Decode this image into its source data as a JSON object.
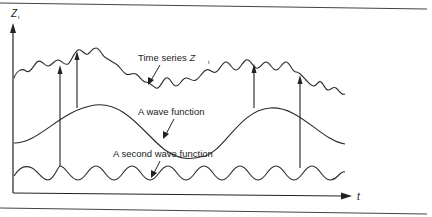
{
  "figure": {
    "axes": {
      "y_label": "Z",
      "y_label_subscript": "t",
      "x_label": "t"
    },
    "labels": {
      "time_series": "Time series ",
      "time_series_var": "Z",
      "time_series_sub": "t",
      "wave_function": "A wave function",
      "second_wave_function": "A second wave function"
    },
    "curves": [
      {
        "name": "Time series Z_t",
        "description": "irregular wiggly curve, rising then falling"
      },
      {
        "name": "A wave function",
        "description": "low-frequency sinusoid"
      },
      {
        "name": "A second wave function",
        "description": "high-frequency sinusoid"
      }
    ],
    "colors": {
      "line": "#2a2a2a",
      "rule": "#444444",
      "background": "#ffffff"
    }
  }
}
